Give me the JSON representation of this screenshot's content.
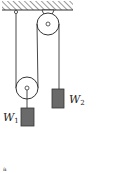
{
  "diagram": {
    "type": "pulley-system",
    "labels": {
      "w1_main": "W",
      "w1_sub": "1",
      "w2_main": "W",
      "w2_sub": "2",
      "caption": "a"
    },
    "colors": {
      "line": "#333333",
      "weight_fill": "#6a6a6a",
      "pulley_fill": "#ffffff"
    }
  }
}
